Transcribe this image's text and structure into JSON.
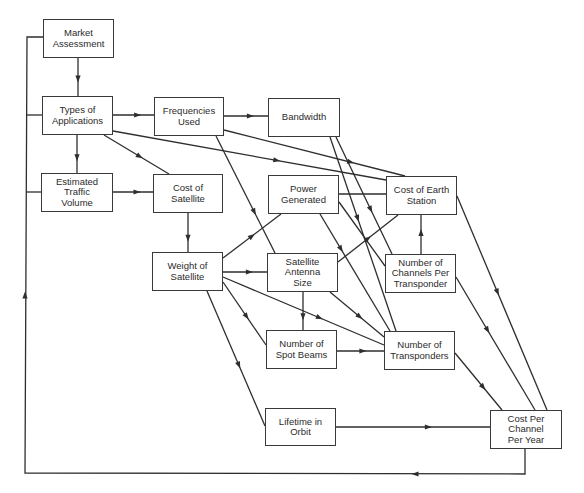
{
  "diagram": {
    "colors": {
      "line": "#2e2e2e",
      "box_border": "#3a3a3a",
      "text": "#2b2b2b",
      "background": "#ffffff"
    },
    "nodes": [
      {
        "id": "market",
        "label": "Market\nAssessment",
        "x": 43,
        "y": 19,
        "w": 71,
        "h": 39
      },
      {
        "id": "types",
        "label": "Types of\nApplications",
        "x": 42,
        "y": 96,
        "w": 71,
        "h": 39
      },
      {
        "id": "traffic",
        "label": "Estimated\nTraffic\nVolume",
        "x": 41,
        "y": 173,
        "w": 72,
        "h": 39
      },
      {
        "id": "freq",
        "label": "Frequencies\nUsed",
        "x": 154,
        "y": 97,
        "w": 70,
        "h": 39
      },
      {
        "id": "bandwidth",
        "label": "Bandwidth",
        "x": 268,
        "y": 98,
        "w": 72,
        "h": 39
      },
      {
        "id": "costsat",
        "label": "Cost of\nSatellite",
        "x": 153,
        "y": 174,
        "w": 70,
        "h": 39
      },
      {
        "id": "power",
        "label": "Power\nGenerated",
        "x": 268,
        "y": 175,
        "w": 71,
        "h": 39
      },
      {
        "id": "earth",
        "label": "Cost of Earth\nStation",
        "x": 386,
        "y": 176,
        "w": 71,
        "h": 39
      },
      {
        "id": "weight",
        "label": "Weight of\nSatellite",
        "x": 152,
        "y": 252,
        "w": 71,
        "h": 39
      },
      {
        "id": "antenna",
        "label": "Satellite\nAntenna\nSize",
        "x": 267,
        "y": 253,
        "w": 71,
        "h": 39
      },
      {
        "id": "channels",
        "label": "Number of\nChannels Per\nTransponder",
        "x": 385,
        "y": 254,
        "w": 71,
        "h": 39
      },
      {
        "id": "spotbeams",
        "label": "Number of\nSpot Beams",
        "x": 266,
        "y": 330,
        "w": 71,
        "h": 39
      },
      {
        "id": "transponders",
        "label": "Number of\nTransponders",
        "x": 384,
        "y": 331,
        "w": 71,
        "h": 39
      },
      {
        "id": "lifetime",
        "label": "Lifetime in\nOrbit",
        "x": 265,
        "y": 408,
        "w": 71,
        "h": 38
      },
      {
        "id": "costchannel",
        "label": "Cost Per\nChannel\nPer Year",
        "x": 490,
        "y": 410,
        "w": 72,
        "h": 39
      }
    ],
    "edges": [
      {
        "from": "market",
        "to": "types",
        "points": [
          [
            78,
            58
          ],
          [
            78,
            96
          ]
        ],
        "arrow_at": 0.55
      },
      {
        "from": "types",
        "to": "freq",
        "points": [
          [
            113,
            115
          ],
          [
            154,
            115
          ]
        ],
        "arrow_at": 0.6
      },
      {
        "from": "types",
        "to": "traffic",
        "points": [
          [
            77,
            135
          ],
          [
            77,
            173
          ]
        ],
        "arrow_at": 0.6
      },
      {
        "from": "types",
        "to": "costsat",
        "points": [
          [
            104,
            135
          ],
          [
            169,
            174
          ]
        ],
        "arrow_at": 0.55
      },
      {
        "from": "types",
        "to": "earth",
        "points": [
          [
            113,
            131
          ],
          [
            386,
            180
          ]
        ],
        "arrow_at": 0.6
      },
      {
        "from": "freq",
        "to": "bandwidth",
        "points": [
          [
            224,
            116
          ],
          [
            268,
            116
          ]
        ],
        "arrow_at": 0.6
      },
      {
        "from": "freq",
        "to": "earth",
        "points": [
          [
            224,
            130
          ],
          [
            405,
            176
          ]
        ],
        "arrow_at": 0.7
      },
      {
        "from": "freq",
        "to": "antenna",
        "points": [
          [
            216,
            136
          ],
          [
            275,
            253
          ]
        ],
        "arrow_at": 0.65
      },
      {
        "from": "traffic",
        "to": "costsat",
        "points": [
          [
            113,
            192
          ],
          [
            153,
            192
          ]
        ],
        "arrow_at": 0.6
      },
      {
        "from": "bandwidth",
        "to": "transponders",
        "points": [
          [
            330,
            137
          ],
          [
            396,
            331
          ]
        ],
        "arrow_at": 0.42
      },
      {
        "from": "bandwidth",
        "to": "channels",
        "points": [
          [
            336,
            137
          ],
          [
            392,
            254
          ]
        ],
        "arrow_at": 0.62
      },
      {
        "from": "power",
        "to": "earth",
        "points": [
          [
            339,
            194
          ],
          [
            386,
            194
          ]
        ],
        "arrow_at": null
      },
      {
        "from": "power",
        "to": "transponders",
        "points": [
          [
            320,
            214
          ],
          [
            390,
            331
          ]
        ],
        "arrow_at": 0.3
      },
      {
        "from": "power",
        "to": "channels",
        "points": [
          [
            339,
            202
          ],
          [
            385,
            266
          ]
        ],
        "arrow_at": null
      },
      {
        "from": "costsat",
        "to": "weight",
        "points": [
          [
            188,
            213
          ],
          [
            188,
            252
          ]
        ],
        "arrow_at": 0.65
      },
      {
        "from": "weight",
        "to": "power",
        "points": [
          [
            223,
            258
          ],
          [
            281,
            214
          ]
        ],
        "arrow_at": 0.5
      },
      {
        "from": "weight",
        "to": "antenna",
        "points": [
          [
            223,
            272
          ],
          [
            267,
            272
          ]
        ],
        "arrow_at": 0.6
      },
      {
        "from": "weight",
        "to": "transponders",
        "points": [
          [
            223,
            277
          ],
          [
            384,
            345
          ]
        ],
        "arrow_at": 0.6
      },
      {
        "from": "weight",
        "to": "spotbeams",
        "points": [
          [
            223,
            282
          ],
          [
            266,
            345
          ]
        ],
        "arrow_at": 0.55
      },
      {
        "from": "weight",
        "to": "lifetime",
        "points": [
          [
            207,
            291
          ],
          [
            265,
            426
          ]
        ],
        "arrow_at": 0.55
      },
      {
        "from": "antenna",
        "to": "earth",
        "points": [
          [
            338,
            262
          ],
          [
            398,
            215
          ]
        ],
        "arrow_at": 0.5
      },
      {
        "from": "antenna",
        "to": "spotbeams",
        "points": [
          [
            303,
            292
          ],
          [
            303,
            330
          ]
        ],
        "arrow_at": 0.65
      },
      {
        "from": "antenna",
        "to": "transponders",
        "points": [
          [
            330,
            292
          ],
          [
            384,
            337
          ]
        ],
        "arrow_at": 0.55
      },
      {
        "from": "channels",
        "to": "earth",
        "points": [
          [
            421,
            254
          ],
          [
            421,
            215
          ]
        ],
        "arrow_at": 0.55
      },
      {
        "from": "channels",
        "to": "costchannel",
        "points": [
          [
            456,
            277
          ],
          [
            535,
            410
          ]
        ],
        "arrow_at": 0.4
      },
      {
        "from": "earth",
        "to": "costchannel",
        "points": [
          [
            457,
            196
          ],
          [
            547,
            410
          ]
        ],
        "arrow_at": 0.45
      },
      {
        "from": "spotbeams",
        "to": "transponders",
        "points": [
          [
            337,
            351
          ],
          [
            384,
            351
          ]
        ],
        "arrow_at": 0.55
      },
      {
        "from": "transponders",
        "to": "costchannel",
        "points": [
          [
            455,
            353
          ],
          [
            502,
            410
          ]
        ],
        "arrow_at": 0.6
      },
      {
        "from": "lifetime",
        "to": "costchannel",
        "points": [
          [
            336,
            427
          ],
          [
            490,
            427
          ]
        ],
        "arrow_at": 0.6
      },
      {
        "from": "costchannel",
        "to": "market",
        "points": [
          [
            525,
            449
          ],
          [
            525,
            474
          ],
          [
            25,
            473
          ],
          [
            27,
            37
          ],
          [
            43,
            37
          ]
        ],
        "arrow_at": null,
        "arrows": [
          [
            [
              420,
              474
            ],
            [
              410,
              474
            ]
          ],
          [
            [
              25,
              300
            ],
            [
              25,
              290
            ]
          ]
        ]
      }
    ],
    "feedback_taps": [
      {
        "to": "types",
        "points": [
          [
            27,
            115
          ],
          [
            42,
            115
          ]
        ]
      },
      {
        "to": "traffic",
        "points": [
          [
            26,
            192
          ],
          [
            41,
            192
          ]
        ]
      }
    ]
  },
  "caption": {
    "text": ""
  }
}
